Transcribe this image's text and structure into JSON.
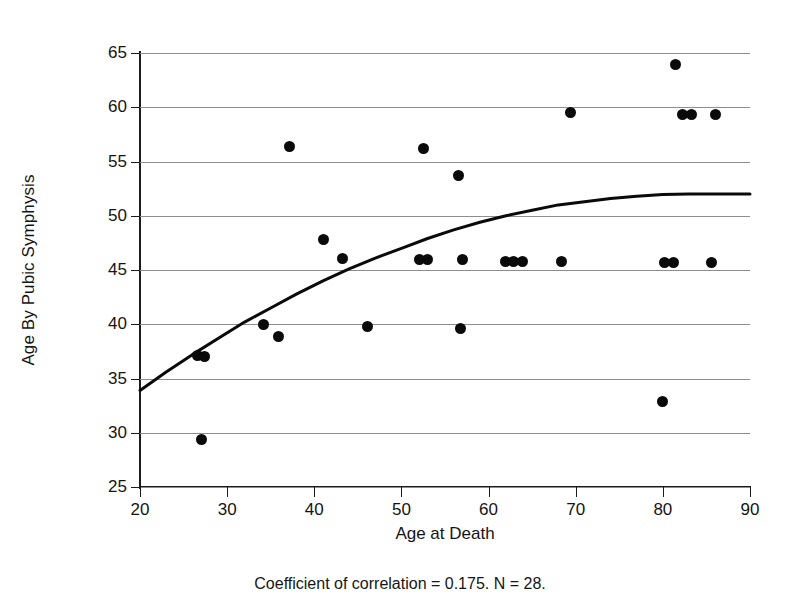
{
  "figure": {
    "caption": "Coefficient of correlation = 0.175. N = 28."
  },
  "chart_data": {
    "type": "scatter",
    "title": "",
    "xlabel": "Age at Death",
    "ylabel": "Age By Pubic Symphysis",
    "xlim": [
      20,
      90
    ],
    "ylim": [
      25,
      65
    ],
    "xticks": [
      20,
      30,
      40,
      50,
      60,
      70,
      80,
      90
    ],
    "yticks": [
      25,
      30,
      35,
      40,
      45,
      50,
      55,
      60,
      65
    ],
    "grid": "horizontal",
    "legend": "none",
    "n_points": 28,
    "coefficient_of_correlation": 0.175,
    "points": [
      {
        "x": 26.6,
        "y": 37.1
      },
      {
        "x": 27.4,
        "y": 37.0
      },
      {
        "x": 27.0,
        "y": 29.4
      },
      {
        "x": 34.2,
        "y": 40.0
      },
      {
        "x": 35.9,
        "y": 38.9
      },
      {
        "x": 37.1,
        "y": 56.4
      },
      {
        "x": 41.0,
        "y": 47.8
      },
      {
        "x": 43.2,
        "y": 46.1
      },
      {
        "x": 46.1,
        "y": 39.8
      },
      {
        "x": 52.1,
        "y": 46.0
      },
      {
        "x": 53.0,
        "y": 46.0
      },
      {
        "x": 52.5,
        "y": 56.2
      },
      {
        "x": 56.6,
        "y": 53.7
      },
      {
        "x": 56.8,
        "y": 39.6
      },
      {
        "x": 57.0,
        "y": 46.0
      },
      {
        "x": 61.9,
        "y": 45.8
      },
      {
        "x": 62.9,
        "y": 45.8
      },
      {
        "x": 63.9,
        "y": 45.8
      },
      {
        "x": 68.4,
        "y": 45.8
      },
      {
        "x": 69.4,
        "y": 59.5
      },
      {
        "x": 80.0,
        "y": 32.9
      },
      {
        "x": 80.2,
        "y": 45.7
      },
      {
        "x": 81.2,
        "y": 45.7
      },
      {
        "x": 81.5,
        "y": 63.9
      },
      {
        "x": 82.3,
        "y": 59.3
      },
      {
        "x": 83.3,
        "y": 59.3
      },
      {
        "x": 85.6,
        "y": 45.7
      },
      {
        "x": 86.0,
        "y": 59.3
      }
    ],
    "fit_curve": {
      "name": "logarithmic-fit",
      "x": [
        20,
        23,
        26,
        29,
        32,
        35,
        38,
        41,
        44,
        47,
        50,
        53,
        56,
        59,
        62,
        65,
        68,
        71,
        74,
        77,
        80,
        83,
        86,
        90
      ],
      "y": [
        33.9,
        35.6,
        37.2,
        38.7,
        40.2,
        41.5,
        42.8,
        44.0,
        45.1,
        46.1,
        47.0,
        47.9,
        48.7,
        49.4,
        50.0,
        50.5,
        51.0,
        51.3,
        51.6,
        51.8,
        51.95,
        52.0,
        52.0,
        52.0
      ]
    }
  }
}
